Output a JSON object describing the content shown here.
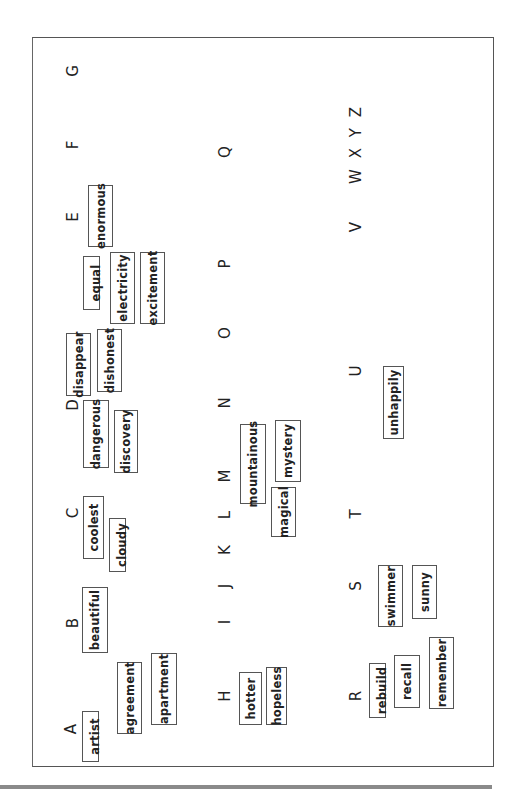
{
  "document": {
    "orientation": "rotated-90-ccw",
    "letters": [
      {
        "id": "A",
        "label": "A",
        "x": 37,
        "y": 38
      },
      {
        "id": "B",
        "label": "B",
        "x": 143,
        "y": 40
      },
      {
        "id": "C",
        "label": "C",
        "x": 253,
        "y": 40
      },
      {
        "id": "D",
        "label": "D",
        "x": 361,
        "y": 40
      },
      {
        "id": "E",
        "label": "E",
        "x": 549,
        "y": 40
      },
      {
        "id": "F",
        "label": "F",
        "x": 621,
        "y": 40
      },
      {
        "id": "G",
        "label": "G",
        "x": 695,
        "y": 40
      },
      {
        "id": "H",
        "label": "H",
        "x": 70,
        "y": 192
      },
      {
        "id": "I",
        "label": "I",
        "x": 144,
        "y": 192
      },
      {
        "id": "J",
        "label": "J",
        "x": 180,
        "y": 192
      },
      {
        "id": "K",
        "label": "K",
        "x": 216,
        "y": 192
      },
      {
        "id": "L",
        "label": "L",
        "x": 251,
        "y": 192
      },
      {
        "id": "M",
        "label": "M",
        "x": 290,
        "y": 192
      },
      {
        "id": "N",
        "label": "N",
        "x": 363,
        "y": 192
      },
      {
        "id": "O",
        "label": "O",
        "x": 433,
        "y": 192
      },
      {
        "id": "P",
        "label": "P",
        "x": 502,
        "y": 192
      },
      {
        "id": "Q",
        "label": "Q",
        "x": 614,
        "y": 192
      },
      {
        "id": "R",
        "label": "R",
        "x": 70,
        "y": 323
      },
      {
        "id": "S",
        "label": "S",
        "x": 180,
        "y": 323
      },
      {
        "id": "T",
        "label": "T",
        "x": 252,
        "y": 323
      },
      {
        "id": "U",
        "label": "U",
        "x": 395,
        "y": 323
      },
      {
        "id": "V",
        "label": "V",
        "x": 539,
        "y": 323
      },
      {
        "id": "WXYZ",
        "label": "W X Y Z",
        "x": 622,
        "y": 323
      }
    ],
    "words": [
      {
        "label": "artist",
        "x": 4,
        "y": 49,
        "w": 51,
        "h": 17,
        "tight": true
      },
      {
        "label": "agreement",
        "x": 32,
        "y": 84,
        "w": 72,
        "h": 25
      },
      {
        "label": "apartment",
        "x": 41,
        "y": 118,
        "w": 72,
        "h": 26
      },
      {
        "label": "beautiful",
        "x": 113,
        "y": 49,
        "w": 66,
        "h": 26
      },
      {
        "label": "coolest",
        "x": 207,
        "y": 50,
        "w": 63,
        "h": 21
      },
      {
        "label": "cloudy",
        "x": 194,
        "y": 76,
        "w": 54,
        "h": 17,
        "tight": true
      },
      {
        "label": "dangerous",
        "x": 298,
        "y": 50,
        "w": 68,
        "h": 26
      },
      {
        "label": "discovery",
        "x": 293,
        "y": 81,
        "w": 63,
        "h": 24
      },
      {
        "label": "disappear",
        "x": 370,
        "y": 33,
        "w": 63,
        "h": 25
      },
      {
        "label": "dishonest",
        "x": 374,
        "y": 64,
        "w": 63,
        "h": 25
      },
      {
        "label": "equal",
        "x": 456,
        "y": 50,
        "w": 54,
        "h": 17,
        "tight": true
      },
      {
        "label": "electricity",
        "x": 442,
        "y": 77,
        "w": 72,
        "h": 25
      },
      {
        "label": "excitement",
        "x": 442,
        "y": 107,
        "w": 72,
        "h": 25
      },
      {
        "label": "enormous",
        "x": 519,
        "y": 55,
        "w": 62,
        "h": 25
      },
      {
        "label": "hotter",
        "x": 41,
        "y": 206,
        "w": 53,
        "h": 23
      },
      {
        "label": "hopeless",
        "x": 41,
        "y": 233,
        "w": 58,
        "h": 21
      },
      {
        "label": "mountainous",
        "x": 262,
        "y": 207,
        "w": 80,
        "h": 26
      },
      {
        "label": "magical",
        "x": 229,
        "y": 238,
        "w": 50,
        "h": 25
      },
      {
        "label": "mystery",
        "x": 284,
        "y": 242,
        "w": 62,
        "h": 26
      },
      {
        "label": "rebuild",
        "x": 48,
        "y": 336,
        "w": 55,
        "h": 17,
        "tight": true
      },
      {
        "label": "recall",
        "x": 58,
        "y": 361,
        "w": 53,
        "h": 26
      },
      {
        "label": "remember",
        "x": 57,
        "y": 396,
        "w": 72,
        "h": 25
      },
      {
        "label": "swimmer",
        "x": 139,
        "y": 345,
        "w": 62,
        "h": 25
      },
      {
        "label": "sunny",
        "x": 147,
        "y": 379,
        "w": 54,
        "h": 25
      },
      {
        "label": "unhappily",
        "x": 327,
        "y": 350,
        "w": 73,
        "h": 21
      }
    ]
  }
}
